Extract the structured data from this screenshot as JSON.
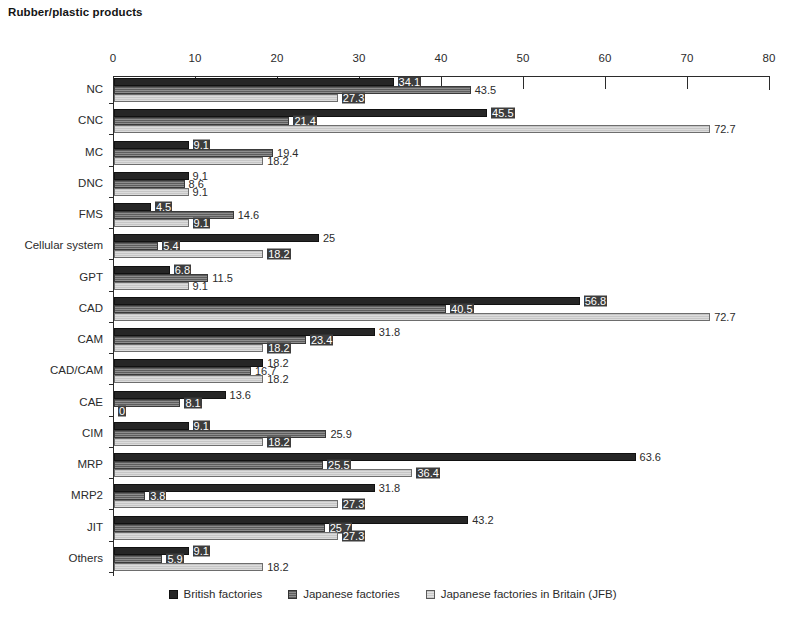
{
  "chart_data": {
    "type": "bar",
    "orientation": "horizontal",
    "title": "Rubber/plastic products",
    "xlabel": "",
    "ylabel": "",
    "xlim": [
      0,
      80
    ],
    "xticks": [
      0,
      10,
      20,
      30,
      40,
      50,
      60,
      70,
      80
    ],
    "grid": false,
    "legend_position": "bottom",
    "categories": [
      "NC",
      "CNC",
      "MC",
      "DNC",
      "FMS",
      "Cellular system",
      "GPT",
      "CAD",
      "CAM",
      "CAD/CAM",
      "CAE",
      "CIM",
      "MRP",
      "MRP2",
      "JIT",
      "Others"
    ],
    "series": [
      {
        "name": "British factories",
        "color": "#262626",
        "values": [
          34.1,
          45.5,
          9.1,
          9.1,
          4.5,
          25,
          6.8,
          56.8,
          31.8,
          18.2,
          13.6,
          9.1,
          63.6,
          31.8,
          43.2,
          9.1
        ],
        "labels": [
          "34.1",
          "45.5",
          "9.1",
          "9.1",
          "4.5",
          "25",
          "6.8",
          "56.8",
          "31.8",
          "18.2",
          "13.6",
          "9.1",
          "63.6",
          "31.8",
          "43.2",
          "9.1"
        ]
      },
      {
        "name": "Japanese factories",
        "color": "#7a7a7a",
        "values": [
          43.5,
          21.4,
          19.4,
          8.6,
          14.6,
          5.4,
          11.5,
          40.5,
          23.4,
          16.7,
          8.1,
          25.9,
          25.5,
          3.8,
          25.7,
          5.9
        ],
        "labels": [
          "43.5",
          "21.4",
          "19.4",
          "8.6",
          "14.6",
          "5.4",
          "11.5",
          "40.5",
          "23.4",
          "16.7",
          "8.1",
          "25.9",
          "25.5",
          "3.8",
          "25.7",
          "5.9"
        ]
      },
      {
        "name": "Japanese factories in Britain (JFB)",
        "color": "#d2d2d2",
        "values": [
          27.3,
          72.7,
          18.2,
          9.1,
          9.1,
          18.2,
          9.1,
          72.7,
          18.2,
          18.2,
          0,
          18.2,
          36.4,
          27.3,
          27.3,
          18.2
        ],
        "labels": [
          "27.3",
          "72.7",
          "18.2",
          "9.1",
          "9.1",
          "18.2",
          "9.1",
          "72.7",
          "18.2",
          "18.2",
          "0",
          "18.2",
          "36.4",
          "27.3",
          "27.3",
          "18.2"
        ]
      }
    ]
  }
}
